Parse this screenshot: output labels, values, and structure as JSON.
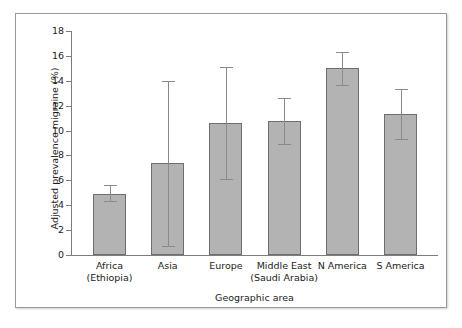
{
  "chart_data": {
    "type": "bar",
    "title": "",
    "xlabel": "Geographic area",
    "ylabel": "Adjusted prevalence migraine (%)",
    "ylim": [
      0,
      18
    ],
    "yticks": [
      0,
      2,
      4,
      6,
      8,
      10,
      12,
      14,
      16,
      18
    ],
    "ytick_labels": [
      "0",
      "2",
      "4",
      "6",
      "8",
      "10",
      "12",
      "14",
      "16",
      "18"
    ],
    "grid": false,
    "legend": "none",
    "error_bars": "asymmetric range (95% CI)",
    "categories": [
      "Africa (Ethiopia)",
      "Asia",
      "Europe",
      "Middle East (Saudi Arabia)",
      "N America",
      "S America"
    ],
    "category_lines": [
      [
        "Africa",
        "(Ethiopia)"
      ],
      [
        "Asia",
        ""
      ],
      [
        "Europe",
        ""
      ],
      [
        "Middle East",
        "(Saudi Arabia)"
      ],
      [
        "N America",
        ""
      ],
      [
        "S America",
        ""
      ]
    ],
    "values": [
      4.9,
      7.4,
      10.6,
      10.8,
      15.05,
      11.35
    ],
    "err_low": [
      4.3,
      0.7,
      6.1,
      8.9,
      13.7,
      9.3
    ],
    "err_high": [
      5.6,
      14.0,
      15.1,
      12.6,
      16.35,
      13.35
    ],
    "series": [
      {
        "name": "Adjusted prevalence migraine (%)",
        "values": [
          4.9,
          7.4,
          10.6,
          10.8,
          15.05,
          11.35
        ]
      }
    ],
    "colors": {
      "bar_fill": "#b3b3b3",
      "bar_stroke": "#6e6e6e",
      "error_bar": "#8a8a8a",
      "axis": "#7d7d7d",
      "text": "#1c1c1c",
      "background": "#ffffff",
      "frame_border": "#9a9a9a"
    }
  }
}
